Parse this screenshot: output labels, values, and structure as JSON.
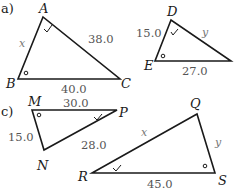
{
  "colors": {
    "stroke": "#1a1a1a",
    "side_text": "#555555",
    "var_text": "#777777",
    "background": "#ffffff"
  },
  "parts": [
    {
      "label": "a)"
    },
    {
      "label": "c)"
    }
  ],
  "triangles": [
    {
      "id": "ABC",
      "vertices": {
        "A": "A",
        "B": "B",
        "C": "C"
      },
      "sides": {
        "AB": "x",
        "AC": "38.0",
        "BC": "40.0"
      },
      "angle_marks": {
        "A": "check",
        "B": "circle"
      }
    },
    {
      "id": "DEF",
      "vertices": {
        "D": "D",
        "E": "E"
      },
      "sides": {
        "DE": "15.0",
        "DF": "y",
        "EF": "27.0"
      },
      "angle_marks": {
        "D": "check",
        "E": "circle"
      }
    },
    {
      "id": "MNP",
      "vertices": {
        "M": "M",
        "N": "N",
        "P": "P"
      },
      "sides": {
        "MN": "15.0",
        "MP": "30.0",
        "NP": "28.0"
      },
      "angle_marks": {
        "M": "circle",
        "P": "check"
      }
    },
    {
      "id": "QRS",
      "vertices": {
        "Q": "Q",
        "R": "R",
        "S": "S"
      },
      "sides": {
        "QR": "x",
        "QS": "y",
        "RS": "45.0"
      },
      "angle_marks": {
        "R": "check",
        "S": "circle"
      }
    }
  ]
}
